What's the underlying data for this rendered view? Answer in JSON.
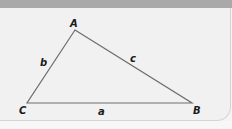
{
  "diagram": {
    "type": "triangle",
    "vertices": [
      {
        "id": "A",
        "label": "A",
        "x": 75,
        "y": 30
      },
      {
        "id": "B",
        "label": "B",
        "x": 192,
        "y": 103
      },
      {
        "id": "C",
        "label": "C",
        "x": 27,
        "y": 103
      }
    ],
    "sides": [
      {
        "id": "a",
        "label": "a",
        "from": "C",
        "to": "B"
      },
      {
        "id": "b",
        "label": "b",
        "from": "C",
        "to": "A"
      },
      {
        "id": "c",
        "label": "c",
        "from": "A",
        "to": "B"
      }
    ],
    "colors": {
      "header": "#a9a9a9",
      "panel": "#f1f1f1",
      "stroke": "#6e6e6e",
      "text": "#1a1a1a"
    }
  }
}
